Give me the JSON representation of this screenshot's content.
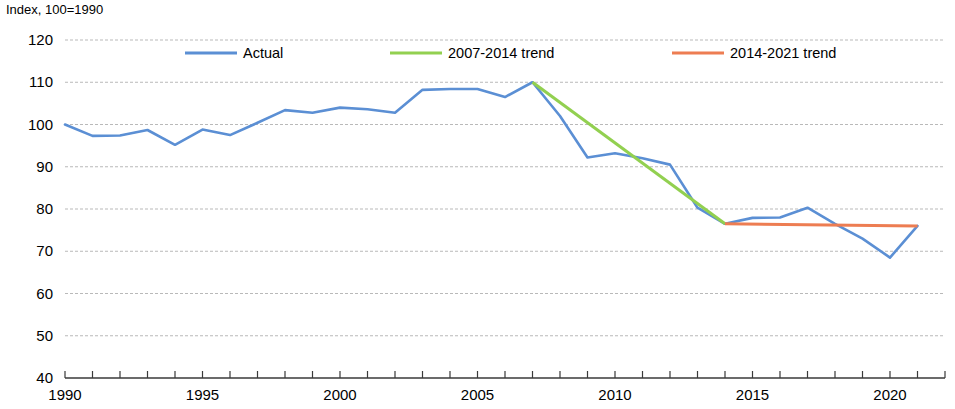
{
  "chart_data": {
    "type": "line",
    "title": "Index, 100=1990",
    "xlabel": "",
    "ylabel": "",
    "ylim": [
      40,
      120
    ],
    "xlim": [
      1990,
      2021
    ],
    "yticks": [
      40,
      50,
      60,
      70,
      80,
      90,
      100,
      110,
      120
    ],
    "xticks": [
      1990,
      1995,
      2000,
      2005,
      2010,
      2015,
      2020
    ],
    "xtick_labels": [
      "1990",
      "1995",
      "2000",
      "2005",
      "2010",
      "2015",
      "2020"
    ],
    "ytick_labels": [
      "40",
      "50",
      "60",
      "70",
      "80",
      "90",
      "100",
      "110",
      "120"
    ],
    "grid": true,
    "grid_axis": "y",
    "legend_position": "top",
    "x": [
      1990,
      1991,
      1992,
      1993,
      1994,
      1995,
      1996,
      1997,
      1998,
      1999,
      2000,
      2001,
      2002,
      2003,
      2004,
      2005,
      2006,
      2007,
      2008,
      2009,
      2010,
      2011,
      2012,
      2013,
      2014,
      2015,
      2016,
      2017,
      2018,
      2019,
      2020,
      2021
    ],
    "series": [
      {
        "name": "Actual",
        "color": "#5B8FD4",
        "x": [
          1990,
          1991,
          1992,
          1993,
          1994,
          1995,
          1996,
          1997,
          1998,
          1999,
          2000,
          2001,
          2002,
          2003,
          2004,
          2005,
          2006,
          2007,
          2008,
          2009,
          2010,
          2011,
          2012,
          2013,
          2014,
          2015,
          2016,
          2017,
          2018,
          2019,
          2020,
          2021
        ],
        "values": [
          100.0,
          97.3,
          97.4,
          98.7,
          95.2,
          98.8,
          97.5,
          100.4,
          103.4,
          102.8,
          104.0,
          103.6,
          102.8,
          108.2,
          108.4,
          108.4,
          106.5,
          110.0,
          102.0,
          92.2,
          93.2,
          92.0,
          90.5,
          80.3,
          76.5,
          77.9,
          78.0,
          80.3,
          76.5,
          73.0,
          68.5,
          76.0
        ]
      },
      {
        "name": "2007-2014 trend",
        "color": "#92D050",
        "x": [
          2007,
          2014
        ],
        "values": [
          110.0,
          76.5
        ]
      },
      {
        "name": "2014-2021 trend",
        "color": "#ED7D52",
        "x": [
          2014,
          2021
        ],
        "values": [
          76.5,
          76.0
        ]
      }
    ]
  },
  "legend": {
    "items": [
      {
        "label": "Actual",
        "color": "#5B8FD4"
      },
      {
        "label": "2007-2014 trend",
        "color": "#92D050"
      },
      {
        "label": "2014-2021 trend",
        "color": "#ED7D52"
      }
    ]
  },
  "axes": {
    "y_axis_title": "Index, 100=1990"
  }
}
